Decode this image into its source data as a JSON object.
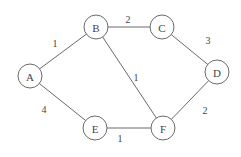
{
  "graph": {
    "nodes": [
      {
        "id": "A",
        "label": "A",
        "x": 30,
        "y": 76
      },
      {
        "id": "B",
        "label": "B",
        "x": 96,
        "y": 27
      },
      {
        "id": "C",
        "label": "C",
        "x": 162,
        "y": 27
      },
      {
        "id": "D",
        "label": "D",
        "x": 217,
        "y": 72
      },
      {
        "id": "E",
        "label": "E",
        "x": 95,
        "y": 128
      },
      {
        "id": "F",
        "label": "F",
        "x": 163,
        "y": 128
      }
    ],
    "edges": [
      {
        "from": "A",
        "to": "B",
        "weight": "1",
        "lx": 55,
        "ly": 43
      },
      {
        "from": "B",
        "to": "C",
        "weight": "2",
        "lx": 128,
        "ly": 19
      },
      {
        "from": "C",
        "to": "D",
        "weight": "3",
        "lx": 208,
        "ly": 40
      },
      {
        "from": "B",
        "to": "F",
        "weight": "1",
        "lx": 136,
        "ly": 77
      },
      {
        "from": "A",
        "to": "E",
        "weight": "4",
        "lx": 44,
        "ly": 109
      },
      {
        "from": "E",
        "to": "F",
        "weight": "1",
        "lx": 120,
        "ly": 138
      },
      {
        "from": "D",
        "to": "F",
        "weight": "2",
        "lx": 205,
        "ly": 110
      }
    ],
    "node_radius": 12
  }
}
